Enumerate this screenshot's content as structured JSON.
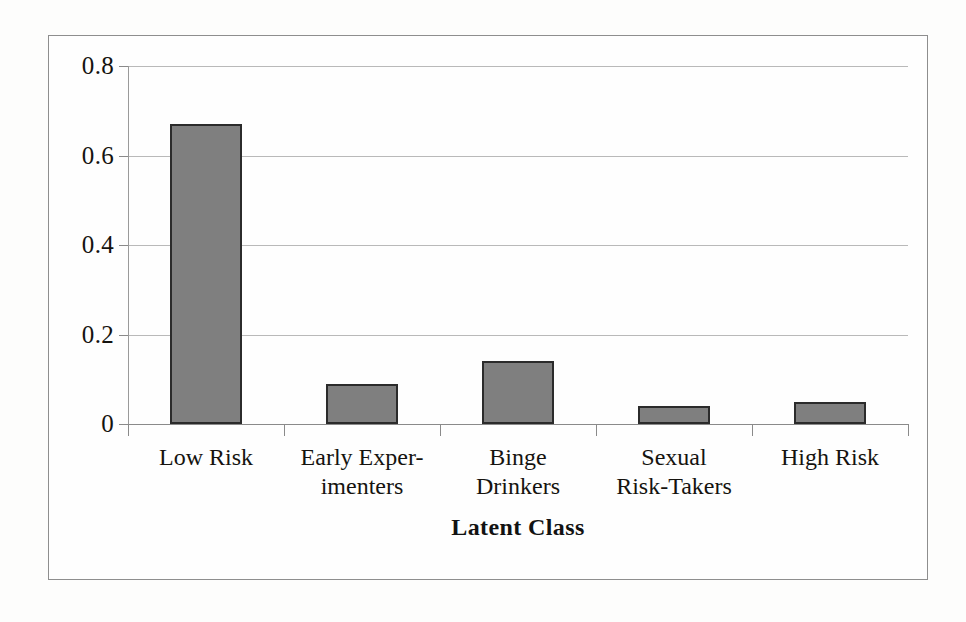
{
  "chart_data": {
    "type": "bar",
    "title": "",
    "xlabel": "Latent Class",
    "ylabel": "",
    "categories": [
      "Low Risk",
      "Early Experimenters",
      "Binge Drinkers",
      "Sexual Risk-Takers",
      "High Risk"
    ],
    "category_lines": [
      [
        "Low Risk"
      ],
      [
        "Early Exper-",
        "imenters"
      ],
      [
        "Binge",
        "Drinkers"
      ],
      [
        "Sexual",
        "Risk-Takers"
      ],
      [
        "High Risk"
      ]
    ],
    "values": [
      0.67,
      0.09,
      0.14,
      0.04,
      0.05
    ],
    "ylim": [
      0,
      0.8
    ],
    "yticks": [
      0,
      0.2,
      0.4,
      0.6,
      0.8
    ],
    "ytick_labels": [
      "0",
      "0.2",
      "0.4",
      "0.6",
      "0.8"
    ],
    "grid": true,
    "legend": "none",
    "bar_fill_color": "#7f7f7f",
    "bar_edge_color": "#2b2b2b",
    "gridline_color": "#b9b9b9",
    "frame_color": "#8e8e8e"
  }
}
